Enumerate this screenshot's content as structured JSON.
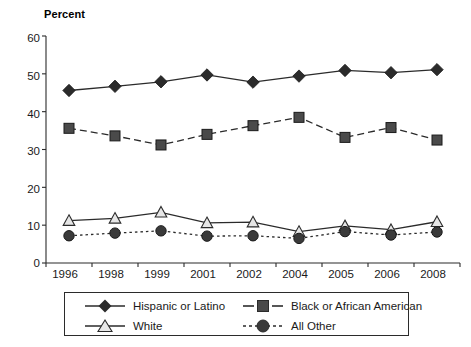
{
  "chart_data": {
    "type": "line",
    "title": "",
    "subtitle": "",
    "xlabel": "",
    "ylabel": "Percent",
    "ylim": [
      0,
      60
    ],
    "yticks": [
      0,
      10,
      20,
      30,
      40,
      50,
      60
    ],
    "grid": false,
    "legend_position": "bottom",
    "categories": [
      "1996",
      "1998",
      "1999",
      "2001",
      "2002",
      "2004",
      "2005",
      "2006",
      "2008"
    ],
    "series": [
      {
        "name": "Hispanic or Latino",
        "marker": "filled-diamond",
        "line_style": "solid",
        "color": "#2b2b2b",
        "values": [
          45.6,
          46.7,
          47.9,
          49.7,
          47.8,
          49.4,
          50.9,
          50.3,
          51.1
        ]
      },
      {
        "name": "Black or African American",
        "marker": "filled-square",
        "line_style": "dashed",
        "color": "#4a4a4a",
        "values": [
          35.6,
          33.6,
          31.2,
          34.0,
          36.3,
          38.5,
          33.2,
          35.8,
          32.5
        ]
      },
      {
        "name": "White",
        "marker": "open-triangle",
        "line_style": "solid",
        "color": "#2b2b2b",
        "values": [
          11.2,
          11.8,
          13.4,
          10.6,
          10.8,
          8.3,
          9.8,
          8.8,
          10.9
        ]
      },
      {
        "name": "All Other",
        "marker": "filled-circle",
        "line_style": "dotted",
        "color": "#3a3a3a",
        "values": [
          7.2,
          7.9,
          8.5,
          7.1,
          7.2,
          6.5,
          8.3,
          7.4,
          8.2
        ]
      }
    ]
  },
  "axis": {
    "y_title": "Percent",
    "y_tick_labels": [
      "60",
      "50",
      "40",
      "30",
      "20",
      "10",
      "0"
    ],
    "x_tick_labels": [
      "1996",
      "1998",
      "1999",
      "2001",
      "2002",
      "2004",
      "2005",
      "2006",
      "2008"
    ]
  },
  "legend": {
    "entries": [
      {
        "label": "Hispanic or Latino"
      },
      {
        "label": "Black or African American"
      },
      {
        "label": "White"
      },
      {
        "label": "All Other"
      }
    ]
  }
}
